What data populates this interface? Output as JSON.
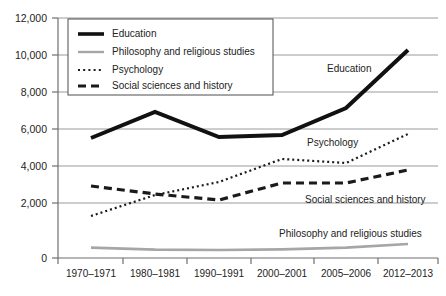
{
  "chart_data": {
    "type": "line",
    "title": "",
    "subtitle": "",
    "xlabel": "",
    "ylabel": "",
    "categories": [
      "1970–1971",
      "1980–1981",
      "1990–1991",
      "2000–2001",
      "2005–2006",
      "2012–2013"
    ],
    "ylim": [
      0,
      12000
    ],
    "ytick_values": [
      0,
      2000,
      4000,
      6000,
      8000,
      10000,
      12000
    ],
    "ytick_labels": [
      "0",
      "2,000",
      "4,000",
      "6,000",
      "8,000",
      "10,000",
      "12,000"
    ],
    "grid": true,
    "grid_axis": "y",
    "legend_position": "upper-left-inside",
    "series": [
      {
        "name": "Education",
        "style": "solid-thick",
        "color": "#111111",
        "values": [
          6000,
          7300,
          6050,
          6150,
          7500,
          10400
        ]
      },
      {
        "name": "Philosophy and religious studies",
        "style": "solid-thin-gray",
        "color": "#a6a6a6",
        "values": [
          520,
          420,
          400,
          430,
          520,
          700
        ]
      },
      {
        "name": "Psychology",
        "style": "dotted",
        "color": "#1a1a1a",
        "values": [
          2100,
          3150,
          3800,
          4950,
          4750,
          6200
        ]
      },
      {
        "name": "Social sciences and history",
        "style": "dashed",
        "color": "#1a1a1a",
        "values": [
          3600,
          3200,
          2900,
          3750,
          3750,
          4400
        ]
      }
    ],
    "annotations": [
      {
        "text": "Education",
        "series": "Education",
        "x_px": 327,
        "y_px": 72
      },
      {
        "text": "Psychology",
        "series": "Psychology",
        "x_px": 307,
        "y_px": 146
      },
      {
        "text": "Social sciences and history",
        "series": "Social sciences and history",
        "x_px": 305,
        "y_px": 203
      },
      {
        "text": "Philosophy and religious studies",
        "series": "Philosophy and religious studies",
        "x_px": 279,
        "y_px": 237
      }
    ],
    "legend_entries": [
      {
        "label": "Education",
        "style": "solid-thick",
        "color": "#111111"
      },
      {
        "label": "Philosophy and religious studies",
        "style": "solid-thin-gray",
        "color": "#a6a6a6"
      },
      {
        "label": "Psychology",
        "style": "dotted",
        "color": "#1a1a1a"
      },
      {
        "label": "Social sciences and history",
        "style": "dashed",
        "color": "#1a1a1a"
      }
    ]
  },
  "axes": {
    "y_tick_labels": [
      "12,000",
      "10,000",
      "8,000",
      "6,000",
      "4,000",
      "2,000",
      "0"
    ],
    "x_tick_labels": [
      "1970–1971",
      "1980–1981",
      "1990–1991",
      "2000–2001",
      "2005–2006",
      "2012–2013"
    ]
  },
  "legend": {
    "items": [
      "Education",
      "Philosophy and religious studies",
      "Psychology",
      "Social sciences and history"
    ]
  },
  "inline_labels": {
    "education": "Education",
    "psychology": "Psychology",
    "social": "Social sciences and history",
    "philosophy": "Philosophy and religious studies"
  }
}
